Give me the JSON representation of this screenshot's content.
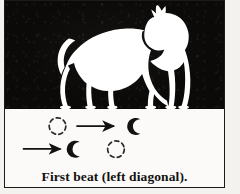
{
  "figure": {
    "caption": "First beat (left diagonal).",
    "colors": {
      "photo_background": "#0b0a09",
      "silhouette": "#ffffff",
      "paper": "#fbfaf8",
      "ink": "#121212",
      "border": "#1b1b1b"
    },
    "photo_panel": {
      "subject": "horse-silhouette",
      "description": "White horse silhouette in trot, facing right",
      "background": "black"
    },
    "footfall_diagram": {
      "description": "Hoofprint footfall pattern for the first beat of the trot",
      "rows": [
        {
          "name": "front-pair-row",
          "prints": [
            {
              "id": "front-left-lifted",
              "state": "lifted",
              "style": "dashed-outline",
              "side": "left"
            },
            {
              "id": "front-right-grounded",
              "state": "grounded",
              "style": "solid",
              "side": "right"
            }
          ],
          "arrow": {
            "id": "front-arrow",
            "direction": "right"
          }
        },
        {
          "name": "hind-pair-row",
          "prints": [
            {
              "id": "hind-left-grounded",
              "state": "grounded",
              "style": "solid",
              "side": "left"
            },
            {
              "id": "hind-right-lifted",
              "state": "lifted",
              "style": "dashed-outline",
              "side": "right"
            }
          ],
          "arrow": {
            "id": "hind-arrow",
            "direction": "right"
          }
        }
      ],
      "legend": {
        "solid_meaning": "hoof on the ground",
        "dashed_meaning": "hoof in the air"
      }
    }
  }
}
